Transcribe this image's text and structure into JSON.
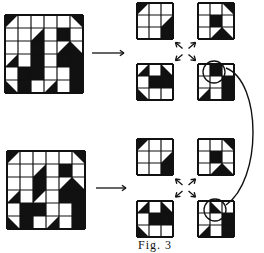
{
  "figure": {
    "caption": "Fig. 3",
    "ink_color": "#111111",
    "paper_color": "#ffffff",
    "cell_legend": {
      "0": "white",
      "1": "black",
      "tl": "black triangle top-left",
      "tr": "black triangle top-right",
      "bl": "black triangle bottom-left",
      "br": "black triangle bottom-right"
    }
  },
  "panels": [
    {
      "name": "top",
      "source_grid": {
        "x": 4,
        "y": 14,
        "cell": 13,
        "size": 6,
        "cells": [
          [
            "tl",
            "0",
            "0",
            "0",
            "0",
            "tr"
          ],
          [
            "0",
            "0",
            "br",
            "0",
            "1",
            "0"
          ],
          [
            "0",
            "0",
            "1",
            "0",
            "br",
            "bl"
          ],
          [
            "br",
            "0",
            "1",
            "0",
            "1",
            "1"
          ],
          [
            "0",
            "1",
            "1",
            "0",
            "0",
            "1"
          ],
          [
            "bl",
            "1",
            "0",
            "br",
            "0",
            "1"
          ]
        ]
      },
      "sub_grids": [
        {
          "x": 136,
          "y": 2,
          "cell": 12,
          "size": 3,
          "cells": [
            [
              "tl",
              "0",
              "0"
            ],
            [
              "0",
              "0",
              "br"
            ],
            [
              "0",
              "0",
              "1"
            ]
          ]
        },
        {
          "x": 197,
          "y": 2,
          "cell": 12,
          "size": 3,
          "cells": [
            [
              "0",
              "0",
              "tr"
            ],
            [
              "0",
              "1",
              "0"
            ],
            [
              "0",
              "br",
              "bl"
            ]
          ]
        },
        {
          "x": 136,
          "y": 63,
          "cell": 12,
          "size": 3,
          "cells": [
            [
              "br",
              "0",
              "bl"
            ],
            [
              "0",
              "1",
              "1"
            ],
            [
              "bl",
              "0",
              "0"
            ]
          ]
        },
        {
          "x": 197,
          "y": 63,
          "cell": 12,
          "size": 3,
          "cells": [
            [
              "0",
              "1",
              "0"
            ],
            [
              "0",
              "0",
              "1"
            ],
            [
              "br",
              "0",
              "1"
            ]
          ]
        }
      ],
      "arrow": {
        "x1": 92,
        "y1": 53,
        "x2": 124,
        "y2": 53
      }
    },
    {
      "name": "bottom",
      "source_grid": {
        "x": 6,
        "y": 150,
        "cell": 13,
        "size": 6,
        "cells": [
          [
            "tl",
            "0",
            "0",
            "0",
            "0",
            "tr"
          ],
          [
            "0",
            "0",
            "br",
            "0",
            "1",
            "0"
          ],
          [
            "0",
            "0",
            "1",
            "0",
            "br",
            "bl"
          ],
          [
            "br",
            "0",
            "tl",
            "0",
            "1",
            "1"
          ],
          [
            "0",
            "1",
            "1",
            "0",
            "0",
            "1"
          ],
          [
            "bl",
            "1",
            "0",
            "br",
            "0",
            "1"
          ]
        ]
      },
      "sub_grids": [
        {
          "x": 136,
          "y": 138,
          "cell": 12,
          "size": 3,
          "cells": [
            [
              "tl",
              "0",
              "0"
            ],
            [
              "0",
              "0",
              "br"
            ],
            [
              "0",
              "0",
              "1"
            ]
          ]
        },
        {
          "x": 197,
          "y": 138,
          "cell": 12,
          "size": 3,
          "cells": [
            [
              "0",
              "0",
              "tr"
            ],
            [
              "0",
              "1",
              "0"
            ],
            [
              "0",
              "br",
              "bl"
            ]
          ]
        },
        {
          "x": 136,
          "y": 200,
          "cell": 12,
          "size": 3,
          "cells": [
            [
              "br",
              "0",
              "bl"
            ],
            [
              "0",
              "1",
              "1"
            ],
            [
              "bl",
              "0",
              "0"
            ]
          ]
        },
        {
          "x": 197,
          "y": 200,
          "cell": 12,
          "size": 3,
          "cells": [
            [
              "0",
              "bl",
              "0"
            ],
            [
              "0",
              "0",
              "1"
            ],
            [
              "br",
              "0",
              "1"
            ]
          ]
        }
      ],
      "arrow": {
        "x1": 96,
        "y1": 188,
        "x2": 126,
        "y2": 188
      }
    }
  ],
  "highlight_circles": [
    {
      "cx": 214,
      "cy": 72,
      "r": 11
    },
    {
      "cx": 215,
      "cy": 210,
      "r": 11
    }
  ],
  "connector_curve": "M 226 68 C 262 82, 262 180, 226 205"
}
